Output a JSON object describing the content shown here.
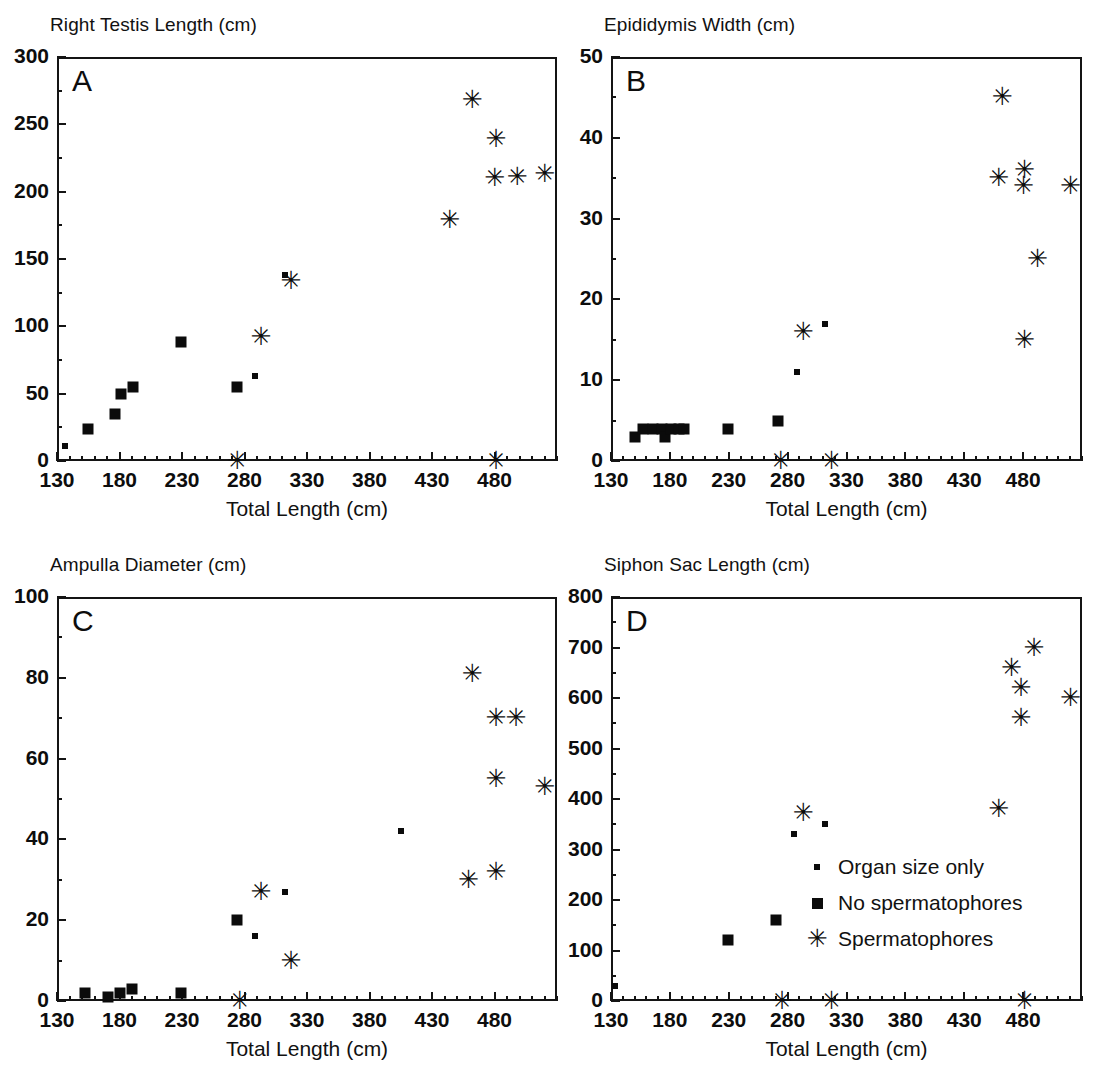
{
  "figure": {
    "background": "#ffffff",
    "marker_color": "#0b0b0b",
    "axis_color": "#141414",
    "xaxis_title": "Total Length (cm)"
  },
  "legend": {
    "entries": [
      {
        "marker": "dot",
        "label": "Organ size only"
      },
      {
        "marker": "square",
        "label": "No spermatophores"
      },
      {
        "marker": "star",
        "label": "Spermatophores"
      }
    ]
  },
  "chart_data": [
    {
      "type": "scatter",
      "panel": "A",
      "title": "Right Testis Length (cm)",
      "xlabel": "Total Length (cm)",
      "ylabel": "Right Testis Length (cm)",
      "xlim": [
        130,
        530
      ],
      "ylim": [
        0,
        300
      ],
      "xticks": [
        130,
        180,
        230,
        280,
        330,
        380,
        430,
        480
      ],
      "yticks": [
        0,
        50,
        100,
        150,
        200,
        250,
        300
      ],
      "grid": false,
      "legend_position": "none",
      "series": [
        {
          "name": "Organ size only",
          "marker": "dot",
          "points": [
            [
              136,
              11
            ],
            [
              288,
              63
            ],
            [
              312,
              138
            ]
          ]
        },
        {
          "name": "No spermatophores",
          "marker": "square",
          "points": [
            [
              155,
              24
            ],
            [
              176,
              35
            ],
            [
              181,
              50
            ],
            [
              191,
              55
            ],
            [
              229,
              88
            ],
            [
              274,
              55
            ]
          ]
        },
        {
          "name": "Spermatophores",
          "marker": "star",
          "points": [
            [
              274,
              0
            ],
            [
              293,
              92
            ],
            [
              317,
              134
            ],
            [
              444,
              179
            ],
            [
              462,
              268
            ],
            [
              481,
              239
            ],
            [
              480,
              210
            ],
            [
              481,
              0
            ],
            [
              498,
              211
            ],
            [
              520,
              213
            ]
          ]
        }
      ]
    },
    {
      "type": "scatter",
      "panel": "B",
      "title": "Epididymis Width (cm)",
      "xlabel": "Total Length (cm)",
      "ylabel": "Epididymis Width (cm)",
      "xlim": [
        130,
        530
      ],
      "ylim": [
        0,
        50
      ],
      "xticks": [
        130,
        180,
        230,
        280,
        330,
        380,
        430,
        480
      ],
      "yticks": [
        0,
        10,
        20,
        30,
        40,
        50
      ],
      "grid": false,
      "legend_position": "none",
      "series": [
        {
          "name": "Organ size only",
          "marker": "dot",
          "points": [
            [
              288,
              11
            ],
            [
              312,
              17
            ]
          ]
        },
        {
          "name": "No spermatophores",
          "marker": "square",
          "points": [
            [
              150,
              3
            ],
            [
              157,
              4
            ],
            [
              166,
              4
            ],
            [
              173,
              4
            ],
            [
              176,
              3
            ],
            [
              181,
              4
            ],
            [
              188,
              4
            ],
            [
              192,
              4
            ],
            [
              229,
              4
            ],
            [
              272,
              5
            ]
          ]
        },
        {
          "name": "Spermatophores",
          "marker": "star",
          "points": [
            [
              274,
              0
            ],
            [
              293,
              16
            ],
            [
              317,
              0
            ],
            [
              459,
              35
            ],
            [
              462,
              45
            ],
            [
              481,
              36
            ],
            [
              480,
              34
            ],
            [
              481,
              15
            ],
            [
              492,
              25
            ],
            [
              520,
              34
            ]
          ]
        }
      ]
    },
    {
      "type": "scatter",
      "panel": "C",
      "title": "Ampulla Diameter (cm)",
      "xlabel": "Total Length (cm)",
      "ylabel": "Ampulla Diameter (cm)",
      "xlim": [
        130,
        530
      ],
      "ylim": [
        0,
        100
      ],
      "xticks": [
        130,
        180,
        230,
        280,
        330,
        380,
        430,
        480
      ],
      "yticks": [
        0,
        20,
        40,
        60,
        80,
        100
      ],
      "grid": false,
      "legend_position": "none",
      "series": [
        {
          "name": "Organ size only",
          "marker": "dot",
          "points": [
            [
              288,
              16
            ],
            [
              312,
              27
            ],
            [
              405,
              42
            ]
          ]
        },
        {
          "name": "No spermatophores",
          "marker": "square",
          "points": [
            [
              152,
              2
            ],
            [
              171,
              1
            ],
            [
              180,
              2
            ],
            [
              190,
              3
            ],
            [
              229,
              2
            ],
            [
              274,
              20
            ]
          ]
        },
        {
          "name": "Spermatophores",
          "marker": "star",
          "points": [
            [
              276,
              0
            ],
            [
              293,
              27
            ],
            [
              317,
              10
            ],
            [
              459,
              30
            ],
            [
              462,
              81
            ],
            [
              481,
              32
            ],
            [
              481,
              55
            ],
            [
              481,
              70
            ],
            [
              497,
              70
            ],
            [
              520,
              53
            ]
          ]
        }
      ]
    },
    {
      "type": "scatter",
      "panel": "D",
      "title": "Siphon Sac Length (cm)",
      "xlabel": "Total Length (cm)",
      "ylabel": "Siphon Sac Length (cm)",
      "xlim": [
        130,
        530
      ],
      "ylim": [
        0,
        800
      ],
      "xticks": [
        130,
        180,
        230,
        280,
        330,
        380,
        430,
        480
      ],
      "yticks": [
        0,
        100,
        200,
        300,
        400,
        500,
        600,
        700,
        800
      ],
      "grid": false,
      "legend_position": "inside-lower-right",
      "series": [
        {
          "name": "Organ size only",
          "marker": "dot",
          "points": [
            [
              133,
              30
            ],
            [
              285,
              330
            ],
            [
              312,
              350
            ]
          ]
        },
        {
          "name": "No spermatophores",
          "marker": "square",
          "points": [
            [
              229,
              120
            ],
            [
              270,
              160
            ]
          ]
        },
        {
          "name": "Spermatophores",
          "marker": "star",
          "points": [
            [
              275,
              0
            ],
            [
              293,
              372
            ],
            [
              317,
              0
            ],
            [
              459,
              380
            ],
            [
              470,
              660
            ],
            [
              478,
              620
            ],
            [
              478,
              560
            ],
            [
              481,
              0
            ],
            [
              489,
              700
            ],
            [
              520,
              600
            ]
          ]
        }
      ]
    }
  ]
}
